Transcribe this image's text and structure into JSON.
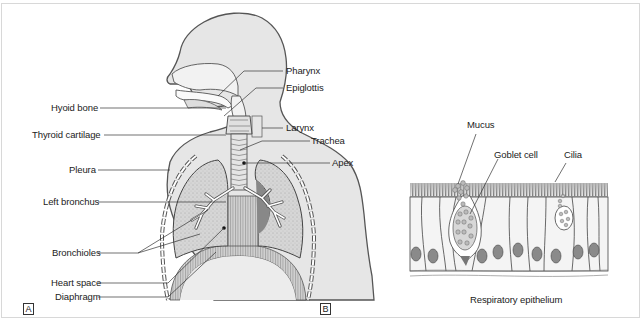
{
  "figure": {
    "panels": [
      {
        "id": "A",
        "tag": "A",
        "subject": "Respiratory system (anterior view)",
        "labels_left": [
          {
            "key": "hyoid",
            "text": "Hyoid bone"
          },
          {
            "key": "thyroid",
            "text": "Thyroid cartilage"
          },
          {
            "key": "pleura",
            "text": "Pleura"
          },
          {
            "key": "left_bronchus",
            "text": "Left bronchus"
          },
          {
            "key": "bronchioles",
            "text": "Bronchioles"
          },
          {
            "key": "heart_space",
            "text": "Heart space"
          },
          {
            "key": "diaphragm",
            "text": "Diaphragm"
          }
        ],
        "labels_right": [
          {
            "key": "pharynx",
            "text": "Pharynx"
          },
          {
            "key": "epiglottis",
            "text": "Epiglottis"
          },
          {
            "key": "larynx",
            "text": "Larynx"
          },
          {
            "key": "trachea",
            "text": "Trachea"
          },
          {
            "key": "apex",
            "text": "Apex"
          }
        ]
      },
      {
        "id": "B",
        "tag": "B",
        "subject": "Respiratory epithelium",
        "labels": [
          {
            "key": "mucus",
            "text": "Mucus"
          },
          {
            "key": "goblet",
            "text": "Goblet cell"
          },
          {
            "key": "cilia",
            "text": "Cilia"
          }
        ],
        "caption": "Respiratory epithelium"
      }
    ],
    "colors": {
      "body_fill": "#e6e6e6",
      "body_stroke": "#555555",
      "lung_fill": "#d4d4d4",
      "label_text": "#222222",
      "frame_border": "#d8d8d8",
      "nucleus_fill": "#8a8a8a"
    }
  }
}
